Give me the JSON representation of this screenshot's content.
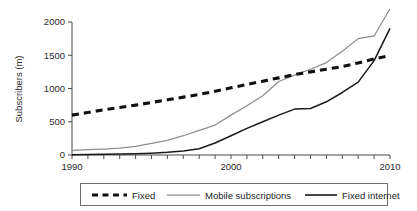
{
  "chart_data": {
    "type": "line",
    "title": "",
    "xlabel": "",
    "ylabel": "Subscribers (m)",
    "xlim": [
      1990,
      2010
    ],
    "ylim": [
      0,
      2000
    ],
    "grid": false,
    "legend_position": "bottom",
    "x_ticks_labeled": [
      "1990",
      "2000",
      "2010"
    ],
    "x_tick_values_labeled": [
      1990,
      2000,
      2010
    ],
    "x_tick_values_all": [
      1990,
      1991,
      1992,
      1993,
      1994,
      1995,
      1996,
      1997,
      1998,
      1999,
      2000,
      2001,
      2002,
      2003,
      2004,
      2005,
      2006,
      2007,
      2008,
      2009,
      2010
    ],
    "y_ticks": [
      "0",
      "500",
      "1000",
      "1500",
      "2000"
    ],
    "y_tick_values": [
      0,
      500,
      1000,
      1500,
      2000
    ],
    "x": [
      1990,
      1991,
      1992,
      1993,
      1994,
      1995,
      1996,
      1997,
      1998,
      1999,
      2000,
      2001,
      2002,
      2003,
      2004,
      2005,
      2006,
      2007,
      2008,
      2009,
      2010
    ],
    "series": [
      {
        "name": "Fixed",
        "style": "dashed",
        "color": "#111111",
        "values": [
          600,
          640,
          680,
          715,
          750,
          790,
          830,
          870,
          910,
          960,
          1010,
          1060,
          1110,
          1160,
          1210,
          1250,
          1290,
          1330,
          1385,
          1445,
          1495
        ]
      },
      {
        "name": "Mobile subscriptions",
        "style": "solid-thin",
        "color": "#8d8d8d",
        "values": [
          70,
          80,
          90,
          105,
          130,
          175,
          220,
          290,
          370,
          450,
          600,
          740,
          890,
          1105,
          1200,
          1290,
          1390,
          1560,
          1750,
          1790,
          2200
        ]
      },
      {
        "name": "Fixed internet",
        "style": "solid",
        "color": "#1a1a1a",
        "values": [
          5,
          8,
          10,
          14,
          20,
          28,
          40,
          60,
          95,
          180,
          290,
          400,
          500,
          600,
          690,
          700,
          800,
          940,
          1095,
          1420,
          1905
        ]
      }
    ],
    "legend": [
      {
        "label": "Fixed",
        "style": "dashed",
        "color": "#111111"
      },
      {
        "label": "Mobile subscriptions",
        "style": "solid-thin",
        "color": "#8d8d8d"
      },
      {
        "label": "Fixed internet",
        "style": "solid",
        "color": "#1a1a1a"
      }
    ]
  }
}
